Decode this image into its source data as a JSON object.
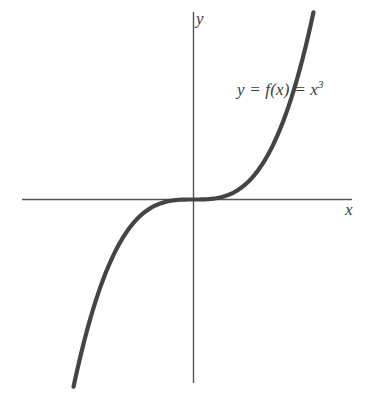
{
  "figure": {
    "background_color": "#ffffff",
    "axis_color": "#555555",
    "curve_color": "#444444"
  },
  "axes": {
    "x_label": "x",
    "y_label": "y"
  },
  "annotations": {
    "equation_prefix": "y = f(x) = x",
    "equation_exponent": "3"
  },
  "chart_data": {
    "type": "line",
    "title": "",
    "xlabel": "x",
    "ylabel": "y",
    "legend": [],
    "grid": false,
    "annotations": [
      "y = f(x) = x³"
    ],
    "series": [
      {
        "name": "y = f(x) = x^3",
        "equation": "y = x^3",
        "x": [
          -1.9,
          -1.8,
          -1.6,
          -1.4,
          -1.2,
          -1.0,
          -0.8,
          -0.6,
          -0.4,
          -0.2,
          0.0,
          0.2,
          0.4,
          0.6,
          0.8,
          1.0,
          1.2,
          1.4,
          1.6,
          1.8,
          1.9
        ],
        "values": [
          -6.859,
          -5.832,
          -4.096,
          -2.744,
          -1.728,
          -1.0,
          -0.512,
          -0.216,
          -0.064,
          -0.008,
          0.0,
          0.008,
          0.064,
          0.216,
          0.512,
          1.0,
          1.728,
          2.744,
          4.096,
          5.832,
          6.859
        ]
      }
    ],
    "xlim": [
      -2.6,
      2.55
    ],
    "ylim": [
      -7.2,
      7.2
    ]
  }
}
